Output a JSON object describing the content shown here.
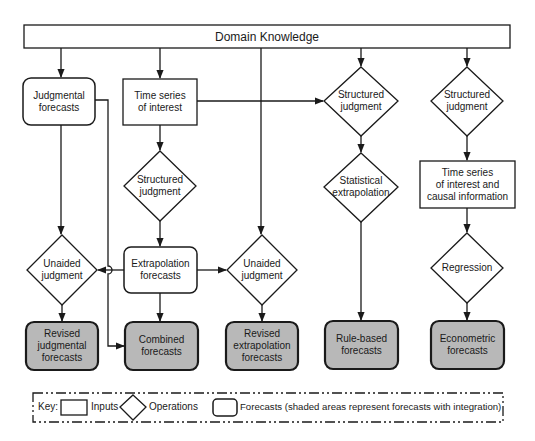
{
  "title": "Domain Knowledge",
  "colors": {
    "stroke": "#1a1a1a",
    "forecast_fill_shaded": "#b8b8b8",
    "background": "#ffffff"
  },
  "nodes": {
    "domain_knowledge": {
      "label": "Domain Knowledge",
      "type": "input-bar"
    },
    "judgmental_forecasts": {
      "label1": "Judgmental",
      "label2": "forecasts",
      "type": "forecast"
    },
    "time_series_interest": {
      "label1": "Time series",
      "label2": "of interest",
      "type": "input"
    },
    "structured_judgment_mid": {
      "label1": "Structured",
      "label2": "judgment",
      "type": "operation"
    },
    "structured_judgment_c4": {
      "label1": "Structured",
      "label2": "judgment",
      "type": "operation"
    },
    "structured_judgment_c5": {
      "label1": "Structured",
      "label2": "judgment",
      "type": "operation"
    },
    "statistical_extrapolation": {
      "label1": "Statistical",
      "label2": "extrapolation",
      "type": "operation"
    },
    "time_series_causal": {
      "label1": "Time series",
      "label2": "of interest and",
      "label3": "causal information",
      "type": "input"
    },
    "unaided_judgment_left": {
      "label1": "Unaided",
      "label2": "judgment",
      "type": "operation"
    },
    "extrapolation_forecasts": {
      "label1": "Extrapolation",
      "label2": "forecasts",
      "type": "forecast"
    },
    "unaided_judgment_mid": {
      "label1": "Unaided",
      "label2": "judgment",
      "type": "operation"
    },
    "regression": {
      "label": "Regression",
      "type": "operation"
    },
    "revised_judgmental": {
      "label1": "Revised",
      "label2": "judgmental",
      "label3": "forecasts",
      "type": "forecast-shaded"
    },
    "combined": {
      "label1": "Combined",
      "label2": "forecasts",
      "type": "forecast-shaded"
    },
    "revised_extrapolation": {
      "label1": "Revised",
      "label2": "extrapolation",
      "label3": "forecasts",
      "type": "forecast-shaded"
    },
    "rule_based": {
      "label1": "Rule-based",
      "label2": "forecasts",
      "type": "forecast-shaded"
    },
    "econometric": {
      "label1": "Econometric",
      "label2": "forecasts",
      "type": "forecast-shaded"
    }
  },
  "edges": [
    [
      "domain_knowledge",
      "judgmental_forecasts"
    ],
    [
      "domain_knowledge",
      "time_series_interest"
    ],
    [
      "domain_knowledge",
      "unaided_judgment_mid"
    ],
    [
      "domain_knowledge",
      "structured_judgment_c4"
    ],
    [
      "domain_knowledge",
      "structured_judgment_c5"
    ],
    [
      "time_series_interest",
      "structured_judgment_c4"
    ],
    [
      "time_series_interest",
      "structured_judgment_mid"
    ],
    [
      "structured_judgment_mid",
      "extrapolation_forecasts"
    ],
    [
      "judgmental_forecasts",
      "unaided_judgment_left"
    ],
    [
      "judgmental_forecasts",
      "combined"
    ],
    [
      "extrapolation_forecasts",
      "unaided_judgment_left"
    ],
    [
      "extrapolation_forecasts",
      "unaided_judgment_mid"
    ],
    [
      "extrapolation_forecasts",
      "combined"
    ],
    [
      "unaided_judgment_left",
      "revised_judgmental"
    ],
    [
      "unaided_judgment_mid",
      "revised_extrapolation"
    ],
    [
      "structured_judgment_c4",
      "statistical_extrapolation"
    ],
    [
      "statistical_extrapolation",
      "rule_based"
    ],
    [
      "structured_judgment_c5",
      "time_series_causal"
    ],
    [
      "time_series_causal",
      "regression"
    ],
    [
      "regression",
      "econometric"
    ]
  ],
  "key": {
    "prefix": "Key:",
    "inputs": "Inputs",
    "operations": "Operations",
    "forecasts": "Forecasts (shaded areas represent forecasts with integration)"
  }
}
